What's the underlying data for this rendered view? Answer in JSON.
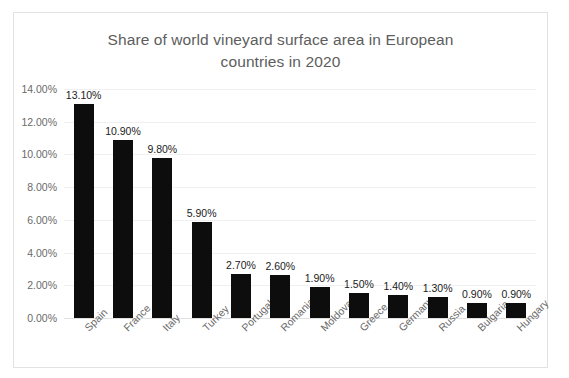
{
  "chart_data": {
    "type": "bar",
    "title": "Share of world vineyard surface area in European countries in 2020",
    "title_lines": [
      "Share of world vineyard surface area in European",
      "countries in 2020"
    ],
    "xlabel": "",
    "ylabel": "",
    "categories": [
      "Spain",
      "France",
      "Italy",
      "Turkey",
      "Portugal",
      "Romania",
      "Moldova",
      "Greece",
      "Germany",
      "Russia",
      "Bulgaria",
      "Hungary"
    ],
    "values": [
      13.1,
      10.9,
      9.8,
      5.9,
      2.7,
      2.6,
      1.9,
      1.5,
      1.4,
      1.3,
      0.9,
      0.9
    ],
    "data_labels": [
      "13.10%",
      "10.90%",
      "9.80%",
      "5.90%",
      "2.70%",
      "2.60%",
      "1.90%",
      "1.50%",
      "1.40%",
      "1.30%",
      "0.90%",
      "0.90%"
    ],
    "ylim": [
      0,
      14
    ],
    "ytick_values": [
      0,
      2,
      4,
      6,
      8,
      10,
      12,
      14
    ],
    "ytick_labels": [
      "0.00%",
      "2.00%",
      "4.00%",
      "6.00%",
      "8.00%",
      "10.00%",
      "12.00%",
      "14.00%"
    ],
    "grid": true,
    "legend": false,
    "legend_position": "none",
    "bar_color": "#0d0d0d",
    "gridline_color": "#f0f0f0",
    "title_color": "#5d5d5d",
    "tick_label_color": "#6a6a6a",
    "data_label_color": "#1b1b1b",
    "background_color": "#ffffff",
    "border_color": "#e2e2e2",
    "category_label_rotation": -45
  }
}
